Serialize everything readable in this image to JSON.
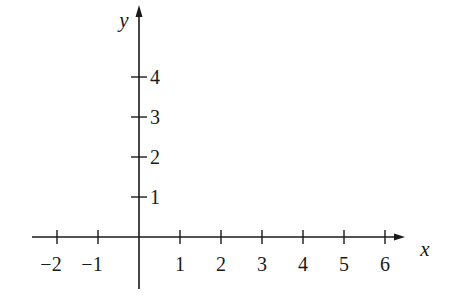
{
  "chart_data": {
    "type": "line",
    "title": "",
    "xlabel": "x",
    "ylabel": "y",
    "xlim": [
      -2.5,
      6.5
    ],
    "ylim": [
      -1.3,
      5.8
    ],
    "x_ticks": [
      -2,
      -1,
      1,
      2,
      3,
      4,
      5,
      6
    ],
    "x_tick_labels": [
      "−2",
      "−1",
      "1",
      "2",
      "3",
      "4",
      "5",
      "6"
    ],
    "y_ticks": [
      1,
      2,
      3,
      4
    ],
    "y_tick_labels": [
      "1",
      "2",
      "3",
      "4"
    ],
    "grid": false,
    "legend": null,
    "series": []
  },
  "colors": {
    "axis": "#1a1a1a",
    "background": "#ffffff"
  }
}
